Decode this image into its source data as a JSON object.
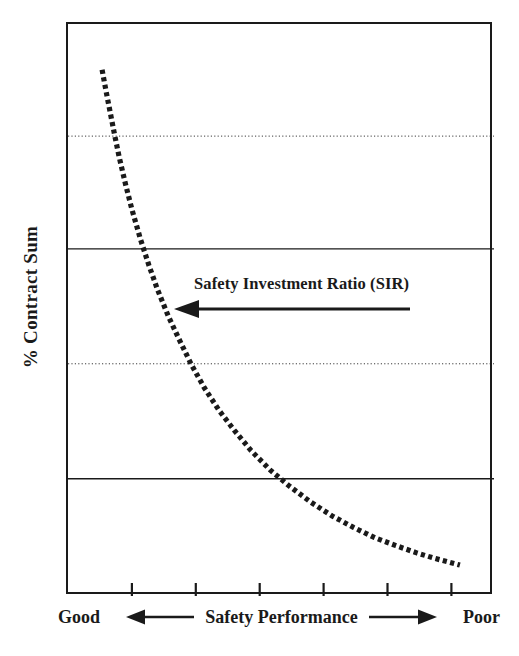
{
  "figure": {
    "background_color": "#ffffff",
    "ink_color": "#1a1a1a"
  },
  "axes": {
    "ylabel": "% Contract Sum",
    "xaxis_caption": {
      "left_word": "Good",
      "center_text": "Safety Performance",
      "right_word": "Poor",
      "left_arrow_icon": "arrow-left-icon",
      "right_arrow_icon": "arrow-right-icon"
    }
  },
  "annotation": {
    "text": "Safety Investment Ratio (SIR)",
    "arrow_icon": "arrow-left-icon",
    "arrow_direction": "left"
  },
  "chart_data": {
    "type": "line",
    "title": "",
    "xlabel": "Safety Performance",
    "ylabel": "% Contract Sum",
    "xlim": [
      0,
      100
    ],
    "ylim": [
      0,
      100
    ],
    "grid": true,
    "legend": "none",
    "axis_tick_labels": {
      "x": [],
      "y": []
    },
    "x_tick_positions_pct": [
      15,
      30,
      45,
      60,
      75,
      90
    ],
    "gridlines": [
      {
        "y_pct": 80.4,
        "style": "dotted"
      },
      {
        "y_pct": 60.7,
        "style": "solid"
      },
      {
        "y_pct": 40.6,
        "style": "dotted"
      },
      {
        "y_pct": 20.5,
        "style": "solid"
      }
    ],
    "series": [
      {
        "name": "Safety Investment Ratio (SIR)",
        "style": "dotted",
        "color": "#1a1a1a",
        "x": [
          8.0,
          9.0,
          10.0,
          11.0,
          12.0,
          13.5,
          15.0,
          17.0,
          19.0,
          21.0,
          23.5,
          26.0,
          29.0,
          32.0,
          35.5,
          39.0,
          43.0,
          47.5,
          52.0,
          57.0,
          62.0,
          67.0,
          72.0,
          77.0,
          82.0,
          86.0,
          89.0,
          92.0
        ],
        "y": [
          92.0,
          88.0,
          84.2,
          80.4,
          76.8,
          72.0,
          67.6,
          62.4,
          57.8,
          53.6,
          49.0,
          45.0,
          40.4,
          36.4,
          32.4,
          29.0,
          25.4,
          22.0,
          19.2,
          16.4,
          14.0,
          12.0,
          10.2,
          8.8,
          7.5,
          6.6,
          6.0,
          5.4
        ]
      }
    ],
    "annotations": [
      {
        "text": "Safety Investment Ratio (SIR)",
        "x_pct_start": 82,
        "x_pct_end": 26,
        "y_pct": 49,
        "arrow": "left"
      }
    ]
  }
}
